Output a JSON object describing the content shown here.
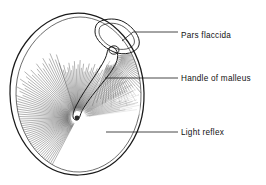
{
  "figure": {
    "background_color": "#ffffff",
    "ink_color": "#1a1a1a",
    "fiber_color": "#4a4a4a",
    "width": 266,
    "height": 185
  },
  "labels": [
    {
      "id": "pars-flaccida",
      "text": "Pars flaccida",
      "text_x": 181,
      "text_y": 38,
      "leader_points": "122,41 133,32 178,32"
    },
    {
      "id": "handle-of-malleus",
      "text": "Handle of malleus",
      "text_x": 181,
      "text_y": 81,
      "leader_points": "105,78 178,78"
    },
    {
      "id": "light-reflex",
      "text": "Light reflex",
      "text_x": 181,
      "text_y": 135,
      "leader_points": "106,132 178,132"
    }
  ],
  "structures": {
    "membrane_outline": {
      "name": "tympanic-membrane-rim",
      "path": "M 78 13 C 112 13 143 47 144 93 C 145 139 116 174 79 175 C 42 176 11 140 10 94 C 9 48 44 13 78 13 Z"
    },
    "membrane_inner_rim": {
      "name": "annulus-inner-edge",
      "path": "M 80 17 C 111 17 140 49 141 93 C 142 137 114 171 80 172 C 46 173 17 139 16 95 C 15 51 49 17 80 17 Z"
    },
    "pars_flaccida": {
      "name": "pars-flaccida-region",
      "path": "M 99 22 C 106 18 117 18 124 22 C 133 27 141 37 139 45 C 137 53 124 56 114 52 C 104 48 95 39 95 32 C 95 27 96 24 99 22 Z"
    },
    "pars_flaccida_fold": {
      "name": "pars-flaccida-inner-fold",
      "path": "M 103 25 C 110 22 118 23 124 27 C 131 32 136 39 134 44 C 132 49 122 51 114 48 C 106 45 99 38 99 32 C 99 28 100 26 103 25 Z"
    },
    "malleus_handle": {
      "name": "malleus-handle-shape",
      "path": "M 113 47 C 118 50 119 56 116 63 C 112 72 103 82 95 92 C 88 101 82 109 80 116 C 79 120 76 121 74 119 C 72 117 73 112 76 106 C 81 96 88 86 94 77 C 100 68 106 59 107 53 C 108 48 110 46 113 47 Z"
    },
    "umbo": {
      "name": "umbo-point",
      "cx": 77,
      "cy": 118,
      "r": 2.4
    },
    "lateral_process": {
      "name": "lateral-process-knob",
      "cx": 114,
      "cy": 50,
      "rx": 5,
      "ry": 4.2
    },
    "light_reflex_cone": {
      "name": "light-reflex-cone-region",
      "path": "M 77 118 L 136 86 L 141 112 L 120 140 L 95 148 Z"
    }
  },
  "fiber_fans": [
    {
      "name": "posterior-radial-fibers",
      "origin_x": 77,
      "origin_y": 118,
      "angle_start": 118,
      "angle_end": 252,
      "count": 58,
      "inner_radius": 6,
      "outer_radius": 70,
      "shade": "mid"
    },
    {
      "name": "inferior-radial-fibers",
      "origin_x": 77,
      "origin_y": 118,
      "angle_start": 252,
      "angle_end": 300,
      "count": 26,
      "inner_radius": 7,
      "outer_radius": 58,
      "shade": "mid"
    },
    {
      "name": "light-reflex-fibers",
      "origin_x": 77,
      "origin_y": 118,
      "angle_start": 300,
      "angle_end": 352,
      "count": 30,
      "inner_radius": 9,
      "outer_radius": 66,
      "shade": "light"
    },
    {
      "name": "anterosuperior-fibers",
      "origin_x": 110,
      "origin_y": 57,
      "angle_start": 352,
      "angle_end": 470,
      "count": 34,
      "inner_radius": 8,
      "outer_radius": 52,
      "shade": "mid"
    }
  ]
}
